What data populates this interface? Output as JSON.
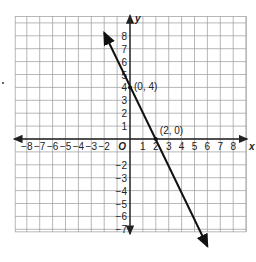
{
  "chart_data": {
    "type": "line",
    "title": "",
    "xlabel": "x",
    "ylabel": "y",
    "origin_label": "O",
    "xlim": [
      -8,
      8
    ],
    "ylim": [
      -7,
      8
    ],
    "grid": true,
    "x_ticks": [
      "-8",
      "-7",
      "-6",
      "-5",
      "-4",
      "-3",
      "-2",
      "1",
      "2",
      "3",
      "4",
      "5",
      "6",
      "7",
      "8"
    ],
    "y_ticks": [
      "8",
      "7",
      "6",
      "5",
      "4",
      "3",
      "2",
      "1",
      "-2",
      "-3",
      "-4",
      "-5",
      "-6",
      "-7"
    ],
    "series": [
      {
        "name": "line",
        "equation": "y = -2x + 4",
        "x": [
          -2,
          6
        ],
        "y": [
          8,
          -8
        ],
        "arrows": "both"
      }
    ],
    "points": [
      {
        "label": "(0, 4)",
        "x": 0,
        "y": 4
      },
      {
        "label": "(2, 0)",
        "x": 2,
        "y": 0
      }
    ]
  },
  "colors": {
    "grid": "#9a9a9a",
    "axis": "#222222",
    "line": "#111111"
  }
}
